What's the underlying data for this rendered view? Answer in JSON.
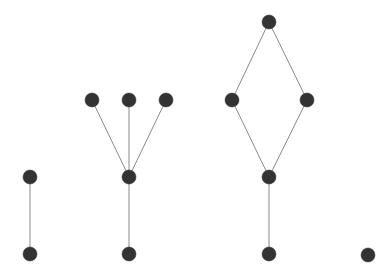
{
  "diagram": {
    "type": "graph",
    "style": {
      "background": "#ffffff",
      "node_fill": "#333333",
      "edge_color": "#8a8a8a",
      "node_radius": 7
    },
    "nodes": [
      {
        "id": "a1",
        "component": "path",
        "x": 30,
        "y": 177
      },
      {
        "id": "a2",
        "component": "path",
        "x": 30,
        "y": 254
      },
      {
        "id": "b1",
        "component": "tree",
        "x": 92,
        "y": 100
      },
      {
        "id": "b2",
        "component": "tree",
        "x": 129,
        "y": 100
      },
      {
        "id": "b3",
        "component": "tree",
        "x": 166,
        "y": 100
      },
      {
        "id": "b4",
        "component": "tree",
        "x": 129,
        "y": 177
      },
      {
        "id": "b5",
        "component": "tree",
        "x": 129,
        "y": 254
      },
      {
        "id": "c1",
        "component": "diamond",
        "x": 269,
        "y": 22
      },
      {
        "id": "c2",
        "component": "diamond",
        "x": 232,
        "y": 100
      },
      {
        "id": "c3",
        "component": "diamond",
        "x": 307,
        "y": 100
      },
      {
        "id": "c4",
        "component": "diamond",
        "x": 269,
        "y": 177
      },
      {
        "id": "c5",
        "component": "diamond",
        "x": 269,
        "y": 254
      },
      {
        "id": "d1",
        "component": "isolated",
        "x": 368,
        "y": 255
      }
    ],
    "edges": [
      {
        "from": "a1",
        "to": "a2"
      },
      {
        "from": "b1",
        "to": "b4"
      },
      {
        "from": "b2",
        "to": "b4"
      },
      {
        "from": "b3",
        "to": "b4"
      },
      {
        "from": "b4",
        "to": "b5"
      },
      {
        "from": "c1",
        "to": "c2"
      },
      {
        "from": "c1",
        "to": "c3"
      },
      {
        "from": "c2",
        "to": "c4"
      },
      {
        "from": "c3",
        "to": "c4"
      },
      {
        "from": "c4",
        "to": "c5"
      }
    ]
  }
}
